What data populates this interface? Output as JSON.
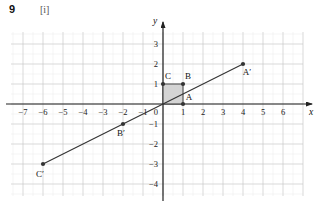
{
  "header": {
    "question_number": "9",
    "part_label": "[i]"
  },
  "chart_data": {
    "type": "scatter",
    "title": "",
    "xlabel": "x",
    "ylabel": "y",
    "grid": true,
    "legend": null,
    "xlim": [
      -7.6,
      7.0
    ],
    "ylim": [
      -4.6,
      3.6
    ],
    "xticks": [
      -7,
      -6,
      -5,
      -4,
      -3,
      -2,
      -1,
      0,
      1,
      2,
      3,
      4,
      5,
      6
    ],
    "xtick_labels": [
      "−7",
      "−6",
      "−5",
      "−4",
      "−3",
      "−2",
      "−1",
      "0",
      "1",
      "2",
      "3",
      "4",
      "5",
      "6"
    ],
    "yticks": [
      -4,
      -3,
      -2,
      -1,
      1,
      2,
      3
    ],
    "ytick_labels": [
      "−4",
      "−3",
      "−2",
      "−1",
      "1",
      "2",
      "3"
    ],
    "origin_label": "0",
    "points": [
      {
        "label": "A",
        "x": 1,
        "y": 0,
        "label_dx": 6,
        "label_dy": -4
      },
      {
        "label": "B",
        "x": 1,
        "y": 1,
        "label_dx": 5,
        "label_dy": -5
      },
      {
        "label": "C",
        "x": 0,
        "y": 1,
        "label_dx": 5,
        "label_dy": -5
      },
      {
        "label": "A′",
        "x": 4,
        "y": 2,
        "label_dx": 4,
        "label_dy": 11
      },
      {
        "label": "B′",
        "x": -2,
        "y": -1,
        "label_dx": -2,
        "label_dy": 12
      },
      {
        "label": "C′",
        "x": -6,
        "y": -3,
        "label_dx": -3,
        "label_dy": 13
      }
    ],
    "shaded_region": {
      "name": "unit-square-OABC",
      "vertices": [
        [
          0,
          0
        ],
        [
          1,
          0
        ],
        [
          1,
          1
        ],
        [
          0,
          1
        ]
      ],
      "fill": "#cccccc",
      "stroke": "#444444"
    },
    "line": {
      "name": "enlargement-ray",
      "from": [
        -6,
        -3
      ],
      "to": [
        4,
        2
      ],
      "slope": 0.5,
      "intercept": 0,
      "stroke": "#333333"
    },
    "colors": {
      "grid_major": "#c9c9c9",
      "grid_minor": "#ebebeb",
      "axis": "#222222",
      "shade_fill": "#cccccc",
      "point": "#333333"
    }
  }
}
